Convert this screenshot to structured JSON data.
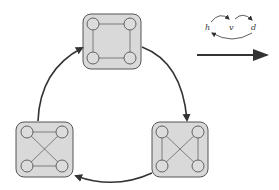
{
  "legend": {
    "labels": [
      "h",
      "v",
      "d"
    ]
  },
  "colors": {
    "box_fill": "#d9d9d9",
    "box_stroke": "#555555",
    "node_fill": "#dcdcdc",
    "edge": "#666666",
    "arrow": "#333333",
    "background": "#ffffff"
  },
  "graphs": [
    {
      "id": "top",
      "pattern": "h+v",
      "edges": [
        "top-horizontal",
        "bottom-horizontal",
        "left-vertical",
        "right-vertical"
      ]
    },
    {
      "id": "bottom-right",
      "pattern": "v+d",
      "edges": [
        "left-vertical",
        "right-vertical",
        "diagonal-1",
        "diagonal-2"
      ]
    },
    {
      "id": "bottom-left",
      "pattern": "h+d",
      "edges": [
        "top-horizontal",
        "bottom-horizontal",
        "diagonal-1",
        "diagonal-2"
      ]
    }
  ],
  "cycle_order": [
    "top",
    "bottom-right",
    "bottom-left",
    "top"
  ]
}
